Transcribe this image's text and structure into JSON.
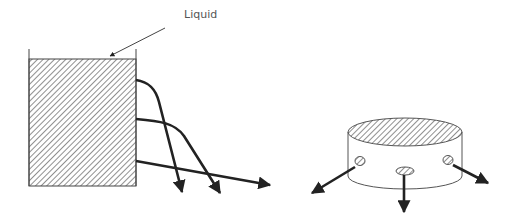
{
  "labels": {
    "liquid": "Liquid"
  },
  "colors": {
    "stroke": "#222222",
    "hatch": "#333333",
    "background": "#ffffff"
  },
  "diagrams": [
    {
      "name": "container-with-side-jets",
      "jets": 3
    },
    {
      "name": "cylinder-with-radial-jets",
      "jets": 3
    }
  ]
}
